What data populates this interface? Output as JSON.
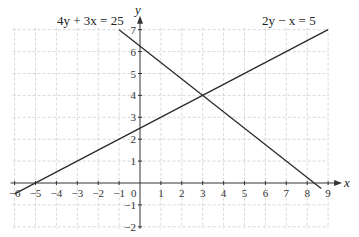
{
  "chart_data": {
    "type": "line",
    "title": "",
    "xlabel": "x",
    "ylabel": "y",
    "xlim": [
      -6,
      9
    ],
    "ylim": [
      -2,
      7
    ],
    "grid": true,
    "x_ticks": [
      -6,
      -5,
      -4,
      -3,
      -2,
      -1,
      0,
      1,
      2,
      3,
      4,
      5,
      6,
      7,
      8,
      9
    ],
    "y_ticks": [
      -2,
      -1,
      1,
      2,
      3,
      4,
      5,
      6,
      7
    ],
    "series": [
      {
        "name": "4y + 3x = 25",
        "equation": "y = (25 - 3x)/4",
        "points": [
          [
            -1,
            7
          ],
          [
            8.67,
            -0.25
          ]
        ]
      },
      {
        "name": "2y − x = 5",
        "equation": "y = (x + 5)/2",
        "points": [
          [
            -6,
            -0.5
          ],
          [
            9,
            7
          ]
        ]
      }
    ],
    "annotations": [
      {
        "text": "4y + 3x = 25",
        "position": "top-left near (-1,7)"
      },
      {
        "text": "2y − x = 5",
        "position": "top-right near (9,7)"
      }
    ],
    "intersection": [
      3,
      4
    ]
  },
  "labels": {
    "x_axis": "x",
    "y_axis": "y",
    "origin": "0",
    "eq1": "4y + 3x = 25",
    "eq2": "2y − x = 5"
  }
}
